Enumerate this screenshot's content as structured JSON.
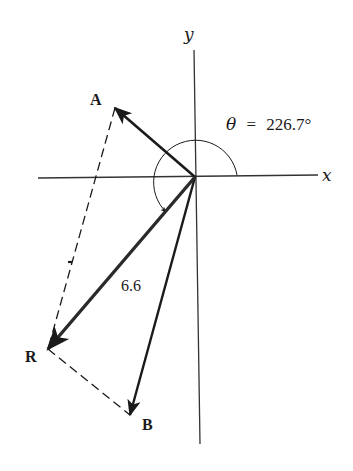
{
  "diagram": {
    "type": "vector-addition",
    "axes": {
      "x_label": "x",
      "y_label": "y"
    },
    "vectors": [
      {
        "name": "A",
        "label": "A",
        "direction": "up-left"
      },
      {
        "name": "B",
        "label": "B",
        "direction": "down, slightly left"
      },
      {
        "name": "R",
        "label": "R",
        "magnitude_label": "6.6",
        "direction": "down-left (resultant)"
      }
    ],
    "angle": {
      "symbol": "θ",
      "equals": "=",
      "value": "226.7°",
      "text": "θ = 226.7°"
    },
    "construction": "parallelogram (dashed lines from A to R and from R to B)",
    "colors": {
      "stroke": "#1a1a1a",
      "axis": "#333333",
      "background": "#ffffff"
    }
  }
}
